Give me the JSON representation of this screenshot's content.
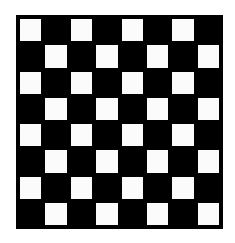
{
  "board": {
    "rows": 8,
    "cols": 8,
    "top_left": "light",
    "colors": {
      "light": "#fbfbfb",
      "dark": "#000000",
      "border": "#000000"
    }
  }
}
